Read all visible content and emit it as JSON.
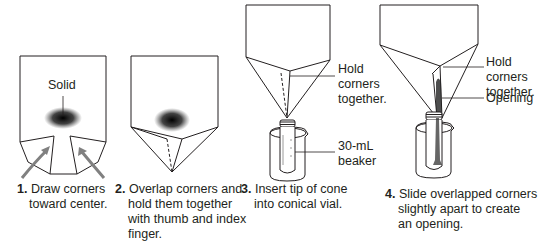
{
  "figure": {
    "steps": [
      {
        "number": "1.",
        "text": "Draw corners toward center.",
        "lines": [
          "Draw corners",
          "toward center."
        ]
      },
      {
        "number": "2.",
        "text": "Overlap corners and hold them together with thumb and index finger.",
        "lines": [
          "Overlap corners and",
          "hold them together",
          "with thumb and index",
          "finger."
        ]
      },
      {
        "number": "3.",
        "text": "Insert tip of cone into conical vial.",
        "lines": [
          "Insert tip of cone",
          "into conical vial."
        ]
      },
      {
        "number": "4.",
        "text": "Slide overlapped corners slightly apart to create an opening.",
        "lines": [
          "Slide overlapped corners",
          "slightly apart to create",
          "an opening."
        ]
      }
    ],
    "labels": {
      "solid": "Solid",
      "hold_corners_3": [
        "Hold",
        "corners",
        "together."
      ],
      "beaker": [
        "30-mL",
        "beaker"
      ],
      "hold_corners_4": [
        "Hold corners",
        "together."
      ],
      "opening": "Opening"
    },
    "colors": {
      "line": "#231f20",
      "arrow": "#7f7f7f",
      "solid": "#1a1a1a"
    }
  }
}
